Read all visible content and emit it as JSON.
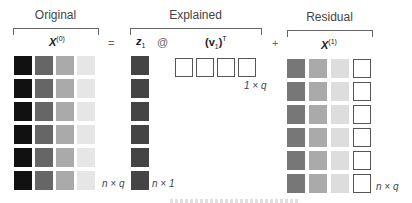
{
  "sections": {
    "original": {
      "title": "Original",
      "matrix_label": "X",
      "matrix_sup": "(0)",
      "dims": "n × q"
    },
    "explained": {
      "title": "Explained",
      "z_label": "z",
      "z_sub": "1",
      "matmul": "@",
      "v_label": "(v",
      "v_sub": "1",
      "v_tail": ")",
      "v_sup": "T",
      "z_dims": "n × 1",
      "v_dims": "1 × q"
    },
    "residual": {
      "title": "Residual",
      "matrix_label": "X",
      "matrix_sup": "(1)",
      "dims": "n × q"
    }
  },
  "operators": {
    "equals": "=",
    "plus": "+"
  },
  "colors": {
    "original_columns": [
      "#111111",
      "#666666",
      "#aaaaaa",
      "#e6e6e6"
    ],
    "z_column": "#444444",
    "residual_columns": [
      "#777777",
      "#aaaaaa",
      "#dddddd",
      "#ffffff"
    ],
    "empty_border": "#555555"
  },
  "grid": {
    "rows": 6,
    "cols": 4
  }
}
